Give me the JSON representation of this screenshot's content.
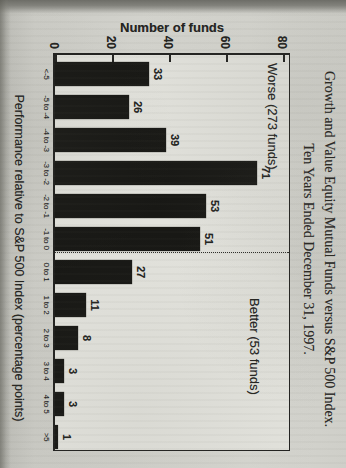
{
  "header": {
    "title_line1": "Growth and Value Equity Mutual Funds versus S&P 500 Index.",
    "title_line2": "Ten Years Ended December 31, 1997."
  },
  "chart_data": {
    "type": "bar",
    "title": "Growth and Value Equity Mutual Funds versus S&P 500 Index. Ten Years Ended December 31, 1997.",
    "categories": [
      "<-5",
      "-5 to -4",
      "-4 to -3",
      "-3 to -2",
      "-2 to -1",
      "-1 to 0",
      "0 to 1",
      "1 to 2",
      "2 to 3",
      "3 to 4",
      "4 to 5",
      ">5"
    ],
    "values": [
      33,
      26,
      39,
      71,
      53,
      51,
      27,
      11,
      8,
      3,
      3,
      1
    ],
    "value_labels": [
      "33",
      "26",
      "39",
      "71",
      "53",
      "51",
      "27",
      "11",
      "8",
      "3",
      "3",
      "1"
    ],
    "xlabel": "Performance relative to S&P 500 Index (percentage points)",
    "ylabel": "Number of funds",
    "yticks": [
      "0",
      "20",
      "40",
      "60",
      "80"
    ],
    "ylim": [
      0,
      80
    ],
    "grid": false,
    "bar_color": "#181815",
    "annotations": [
      {
        "text": "Worse (273 funds)",
        "region": "left-of-separator"
      },
      {
        "text": "Better (53 funds)",
        "region": "right-of-separator"
      }
    ],
    "separator": {
      "style": "dotted",
      "after_category": "-1 to 0"
    },
    "layout_note_totals": {
      "worse_total": 273,
      "better_total": 53
    }
  }
}
